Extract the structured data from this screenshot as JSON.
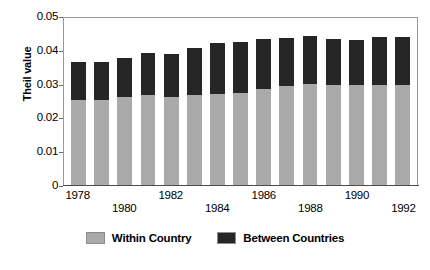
{
  "chart_data": {
    "type": "bar",
    "subtype": "stacked-vertical",
    "title": "",
    "xlabel": "",
    "ylabel": "Theil value",
    "ylim": [
      0,
      0.05
    ],
    "yticks": [
      "0.05",
      "0.04",
      "0.03",
      "0.02",
      "0.01",
      "0"
    ],
    "ytick_values": [
      0.05,
      0.04,
      0.03,
      0.02,
      0.01,
      0
    ],
    "grid": false,
    "legend_position": "bottom",
    "categories": [
      "1978",
      "1979",
      "1980",
      "1981",
      "1982",
      "1983",
      "1984",
      "1985",
      "1986",
      "1987",
      "1988",
      "1989",
      "1990",
      "1991",
      "1992"
    ],
    "xtick_labels_shown": [
      "1978",
      "1980",
      "1982",
      "1984",
      "1986",
      "1988",
      "1990",
      "1992"
    ],
    "series": [
      {
        "name": "Within Country",
        "color": "#aaaaaa",
        "values": [
          0.0251,
          0.0252,
          0.026,
          0.0266,
          0.0261,
          0.0265,
          0.0268,
          0.0271,
          0.0285,
          0.0292,
          0.0299,
          0.0297,
          0.0296,
          0.0296,
          0.0296
        ]
      },
      {
        "name": "Between Countries",
        "color": "#262626",
        "values": [
          0.0112,
          0.0112,
          0.0116,
          0.0124,
          0.0128,
          0.0139,
          0.0152,
          0.0151,
          0.0147,
          0.0144,
          0.0143,
          0.0136,
          0.0133,
          0.0143,
          0.0143
        ]
      }
    ],
    "totals": [
      0.0363,
      0.0364,
      0.0376,
      0.039,
      0.0389,
      0.0404,
      0.042,
      0.0422,
      0.0432,
      0.0436,
      0.0442,
      0.0433,
      0.0429,
      0.0439,
      0.0439
    ]
  },
  "legend": {
    "items": [
      {
        "label": "Within Country",
        "color": "#aaaaaa"
      },
      {
        "label": "Between Countries",
        "color": "#262626"
      }
    ]
  }
}
